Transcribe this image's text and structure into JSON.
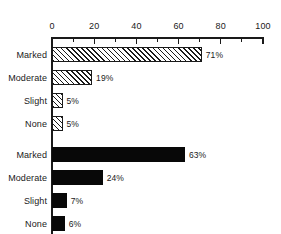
{
  "chart_data": {
    "type": "bar",
    "orientation": "horizontal",
    "title": "",
    "subtitle": "",
    "xlabel": "",
    "ylabel": "",
    "xlim": [
      0,
      100
    ],
    "grid": false,
    "legend": null,
    "axis": {
      "position": "top",
      "major_ticks": [
        0,
        20,
        40,
        60,
        80,
        100
      ],
      "minor_ticks": [
        10,
        30,
        50,
        70,
        90
      ],
      "tick_labels": [
        "0",
        "20",
        "40",
        "60",
        "80",
        "100"
      ]
    },
    "categories": [
      "Marked",
      "Moderate",
      "Slight",
      "None"
    ],
    "series": [
      {
        "name": "group-1",
        "fill": "hatched",
        "values": [
          71,
          19,
          5,
          5
        ],
        "value_labels": [
          "71%",
          "19%",
          "5%",
          "5%"
        ]
      },
      {
        "name": "group-2",
        "fill": "solid",
        "values": [
          63,
          24,
          7,
          6
        ],
        "value_labels": [
          "63%",
          "24%",
          "7%",
          "6%"
        ]
      }
    ],
    "colors": {
      "axis": "#1a1a1a",
      "text": "#1a1a1a",
      "bar_solid": "#080808",
      "bar_hatch_line": "#1a1a1a",
      "bar_hatch_background": "#ffffff",
      "page_background": "#ffffff"
    },
    "bars": [
      {
        "group": 1,
        "category": "Marked",
        "value": 71,
        "label": "71%",
        "fill": "hatched",
        "top": 47
      },
      {
        "group": 1,
        "category": "Moderate",
        "value": 19,
        "label": "19%",
        "fill": "hatched",
        "top": 70
      },
      {
        "group": 1,
        "category": "Slight",
        "value": 5,
        "label": "5%",
        "fill": "hatched",
        "top": 93
      },
      {
        "group": 1,
        "category": "None",
        "value": 5,
        "label": "5%",
        "fill": "hatched",
        "top": 116
      },
      {
        "group": 2,
        "category": "Marked",
        "value": 63,
        "label": "63%",
        "fill": "solid",
        "top": 147
      },
      {
        "group": 2,
        "category": "Moderate",
        "value": 24,
        "label": "24%",
        "fill": "solid",
        "top": 170
      },
      {
        "group": 2,
        "category": "Slight",
        "value": 7,
        "label": "7%",
        "fill": "solid",
        "top": 193
      },
      {
        "group": 2,
        "category": "None",
        "value": 6,
        "label": "6%",
        "fill": "solid",
        "top": 216
      }
    ]
  }
}
